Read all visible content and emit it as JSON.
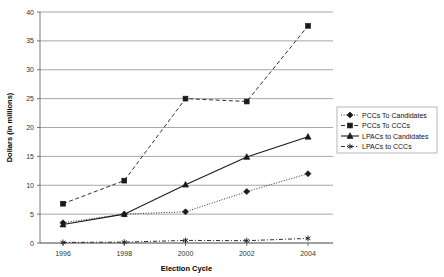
{
  "chart_data": {
    "type": "line",
    "title": "",
    "xlabel": "Election Cycle",
    "ylabel": "Dollars (in millions)",
    "categories": [
      "1996",
      "1998",
      "2000",
      "2002",
      "2004"
    ],
    "x_tick_labels": [
      "1996",
      "1998",
      "2000",
      "2002",
      "2004"
    ],
    "y_tick_labels": [
      "0",
      "5",
      "10",
      "15",
      "20",
      "25",
      "30",
      "35",
      "40"
    ],
    "y_ticks": [
      0,
      5,
      10,
      15,
      20,
      25,
      30,
      35,
      40
    ],
    "ylim": [
      0,
      40
    ],
    "grid": true,
    "legend_position": "right",
    "series": [
      {
        "name": "PCCs To Candidates",
        "marker": "diamond",
        "line_style": "dotted",
        "values": [
          3.5,
          5.0,
          5.4,
          8.9,
          12.0
        ]
      },
      {
        "name": "PCCs To CCCs",
        "marker": "square",
        "line_style": "dashed",
        "values": [
          6.8,
          10.8,
          25.0,
          24.5,
          37.6
        ]
      },
      {
        "name": "LPACs to Candidates",
        "marker": "triangle",
        "line_style": "solid",
        "values": [
          3.2,
          5.0,
          10.1,
          14.9,
          18.4
        ]
      },
      {
        "name": "LPACs to CCCs",
        "marker": "star",
        "line_style": "dash-dot",
        "values": [
          0.1,
          0.15,
          0.45,
          0.4,
          0.8
        ]
      }
    ]
  },
  "legend": {
    "entries": [
      "PCCs To Candidates",
      "PCCs To CCCs",
      "LPACs to Candidates",
      "LPACs to CCCs"
    ]
  },
  "header": {
    "cropped_caption": ""
  }
}
